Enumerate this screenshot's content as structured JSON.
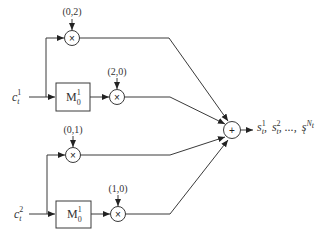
{
  "diagram": {
    "inputs": [
      {
        "base": "c",
        "sub": "t",
        "sup": "1"
      },
      {
        "base": "c",
        "sub": "t",
        "sup": "2"
      }
    ],
    "blocks": [
      {
        "base": "M",
        "sub": "0",
        "sup": "1"
      },
      {
        "base": "M",
        "sub": "0",
        "sup": "1"
      }
    ],
    "multipliers": [
      {
        "symbol": "×",
        "coef": "(0,2)"
      },
      {
        "symbol": "×",
        "coef": "(2,0)"
      },
      {
        "symbol": "×",
        "coef": "(0,1)"
      },
      {
        "symbol": "×",
        "coef": "(1,0)"
      }
    ],
    "sum": {
      "symbol": "+"
    },
    "output": {
      "s1_base": "s",
      "s1_sub": "t",
      "s1_sup": "1",
      "sep1": ",",
      "s2_base": "s",
      "s2_sub": "t",
      "s2_sup": "2",
      "sep2": ", ...,",
      "sN_base": "s",
      "sN_sub": "t",
      "sN_sup": "N",
      "sN_sup_sub": "t"
    }
  }
}
